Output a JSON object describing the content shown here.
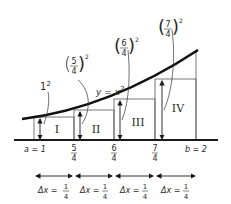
{
  "diagram": {
    "curve_label": "y = x",
    "curve_label_exp": "2",
    "rect_labels": [
      "I",
      "II",
      "III",
      "IV"
    ],
    "height_labels": [
      {
        "base": "1",
        "exp": "2"
      },
      {
        "num": "5",
        "den": "4",
        "exp": "2"
      },
      {
        "num": "6",
        "den": "4",
        "exp": "2"
      },
      {
        "num": "7",
        "den": "4",
        "exp": "2"
      }
    ],
    "axis_ticks": [
      {
        "text": "a = 1"
      },
      {
        "num": "5",
        "den": "4"
      },
      {
        "num": "6",
        "den": "4"
      },
      {
        "num": "7",
        "den": "4"
      },
      {
        "text": "b = 2"
      }
    ],
    "delta_labels": [
      {
        "prefix": "Δx =",
        "num": "1",
        "den": "4"
      },
      {
        "prefix": "Δx =",
        "num": "1",
        "den": "4"
      },
      {
        "prefix": "Δx =",
        "num": "1",
        "den": "4"
      },
      {
        "prefix": "Δx =",
        "num": "1",
        "den": "4"
      }
    ],
    "colors": {
      "ink": "#1a1a1a",
      "thin": "#555555"
    }
  }
}
